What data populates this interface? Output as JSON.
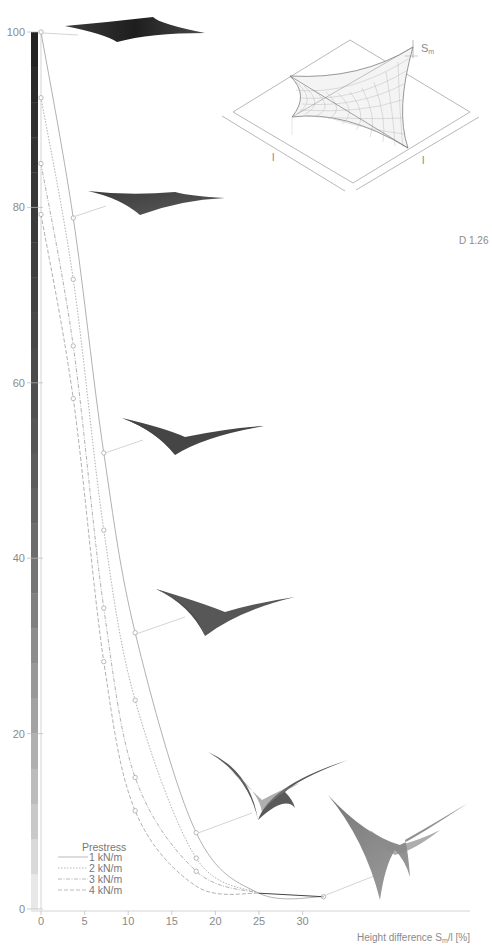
{
  "figure_label": "D 1.26",
  "chart_data": {
    "type": "line",
    "title": "",
    "xlabel": "Height difference S_m/l [%]",
    "xlabel_main": "Height difference S",
    "xlabel_sub": "m",
    "xlabel_tail": "/l [%]",
    "ylabel": "",
    "xlim": [
      -1,
      35
    ],
    "ylim": [
      0,
      100
    ],
    "x_ticks": [
      0,
      5,
      10,
      15,
      20,
      25,
      30
    ],
    "y_ticks": [
      0,
      20,
      40,
      60,
      80,
      100
    ],
    "grid": false,
    "legend_title": "Prestress",
    "legend_position": "lower-left",
    "series": [
      {
        "name": "1 kN/m",
        "style": "solid",
        "x": [
          0,
          3.7,
          7.2,
          10.8,
          17.8,
          25,
          32.4
        ],
        "y": [
          100,
          78.8,
          52,
          31.5,
          8.7,
          1.8,
          1.4
        ],
        "markers_x": [
          0,
          3.7,
          7.2,
          10.8,
          17.8,
          32.4
        ],
        "markers_y": [
          100,
          78.8,
          52,
          31.5,
          8.7,
          1.4
        ]
      },
      {
        "name": "2 kN/m",
        "style": "dotted",
        "x": [
          0,
          3.7,
          7.2,
          10.8,
          17.8,
          25
        ],
        "y": [
          92.5,
          71.8,
          43.2,
          23.8,
          5.8,
          1.8
        ],
        "markers_x": [
          0,
          3.7,
          7.2,
          10.8,
          17.8
        ],
        "markers_y": [
          92.5,
          71.8,
          43.2,
          23.8,
          5.8
        ]
      },
      {
        "name": "3 kN/m",
        "style": "dash-dot",
        "x": [
          0,
          3.7,
          7.2,
          10.8,
          17.8,
          25
        ],
        "y": [
          85,
          64.2,
          34.3,
          15,
          4.3,
          1.8
        ],
        "markers_x": [
          0,
          3.7,
          7.2,
          10.8,
          17.8
        ],
        "markers_y": [
          85,
          64.2,
          34.3,
          15,
          4.3
        ]
      },
      {
        "name": "4 kN/m",
        "style": "dashed",
        "x": [
          0,
          3.7,
          7.2,
          10.8,
          17.8,
          25
        ],
        "y": [
          79.2,
          58.2,
          28.2,
          11.2,
          2.6,
          1.8
        ],
        "markers_x": [
          0,
          3.7,
          7.2,
          10.8
        ],
        "markers_y": [
          79.2,
          58.2,
          28.2,
          11.2
        ]
      }
    ],
    "color_scale": {
      "description": "vertical grey gradient bar along y-axis, dark at 100, light at 0",
      "steps": [
        "#e8e8e8",
        "#d9d9d9",
        "#c9c9c9",
        "#bcbcbc",
        "#b0b0b0",
        "#a3a3a3",
        "#989898",
        "#8c8c8c",
        "#808080",
        "#757575",
        "#6c6c6c",
        "#636363",
        "#5c5c5c",
        "#565656",
        "#505050",
        "#4b4b4b",
        "#474747",
        "#434343",
        "#3f3f3f",
        "#3b3b3b",
        "#373737",
        "#333333",
        "#2e2e2e",
        "#292929",
        "#232323"
      ]
    },
    "annotations": [
      "Inset: isometric membrane on square base with side labels l, l and sag S_m",
      "Membrane shape renders connected to markers of 1 kN/m curve"
    ]
  },
  "legend": {
    "title": "Prestress",
    "items": [
      "1 kN/m",
      "2 kN/m",
      "3 kN/m",
      "4 kN/m"
    ]
  },
  "inset": {
    "side_label_left": "l",
    "side_label_right": "l",
    "sag_label": "S",
    "sag_sub": "m"
  },
  "colors": {
    "axis": "#9a9a9a",
    "curve": "#a8a8a8",
    "membrane_dark": "#2b2b2b",
    "membrane_mid": "#4e4e4e",
    "membrane_light": "#8c8c8c"
  }
}
